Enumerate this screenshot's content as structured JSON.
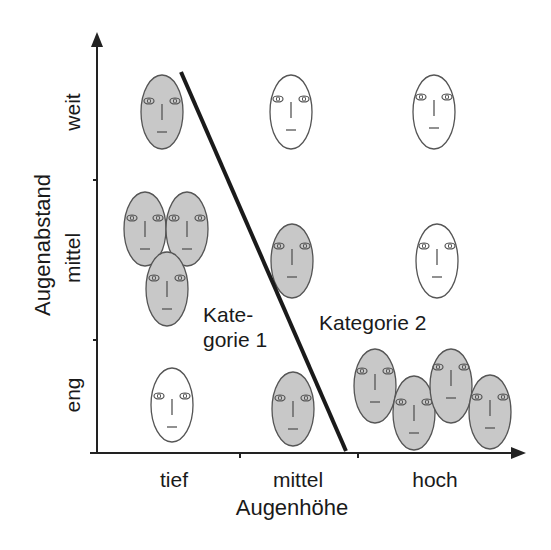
{
  "diagram": {
    "y_axis": {
      "title": "Augenabstand",
      "ticks": [
        "eng",
        "mittel",
        "weit"
      ]
    },
    "x_axis": {
      "title": "Augenhöhe",
      "ticks": [
        "tief",
        "mittel",
        "hoch"
      ]
    },
    "regions": [
      {
        "label_line1": "Kate-",
        "label_line2": "gorie 1"
      },
      {
        "label": "Kategorie 2"
      }
    ],
    "colors": {
      "axis": "#222222",
      "face_gray": "#c8c8c8",
      "face_white": "#ffffff",
      "face_stroke": "#555555",
      "separator": "#1a1a1a"
    },
    "faces": [
      {
        "cell": "weit-tief",
        "cx": 162,
        "cy": 112,
        "fill": "gray",
        "category": 1
      },
      {
        "cell": "weit-mittel",
        "cx": 291,
        "cy": 112,
        "fill": "white",
        "category": 2
      },
      {
        "cell": "weit-hoch",
        "cx": 434,
        "cy": 112,
        "fill": "white",
        "category": 2
      },
      {
        "cell": "mittel-tief",
        "cx": 145,
        "cy": 229,
        "fill": "gray",
        "category": 1
      },
      {
        "cell": "mittel-tief",
        "cx": 187,
        "cy": 229,
        "fill": "gray",
        "category": 1
      },
      {
        "cell": "mittel-tief",
        "cx": 167,
        "cy": 289,
        "fill": "gray",
        "category": 1
      },
      {
        "cell": "mittel-mittel",
        "cx": 292,
        "cy": 261,
        "fill": "gray",
        "category": 2
      },
      {
        "cell": "mittel-hoch",
        "cx": 437,
        "cy": 261,
        "fill": "white",
        "category": 2
      },
      {
        "cell": "eng-tief",
        "cx": 172,
        "cy": 405,
        "fill": "white",
        "category": 1
      },
      {
        "cell": "eng-mittel",
        "cx": 293,
        "cy": 409,
        "fill": "gray",
        "category": 2
      },
      {
        "cell": "eng-hoch",
        "cx": 375,
        "cy": 386,
        "fill": "gray",
        "category": 2
      },
      {
        "cell": "eng-hoch",
        "cx": 414,
        "cy": 413,
        "fill": "gray",
        "category": 2
      },
      {
        "cell": "eng-hoch",
        "cx": 451,
        "cy": 386,
        "fill": "gray",
        "category": 2
      },
      {
        "cell": "eng-hoch",
        "cx": 490,
        "cy": 412,
        "fill": "gray",
        "category": 2
      }
    ]
  }
}
